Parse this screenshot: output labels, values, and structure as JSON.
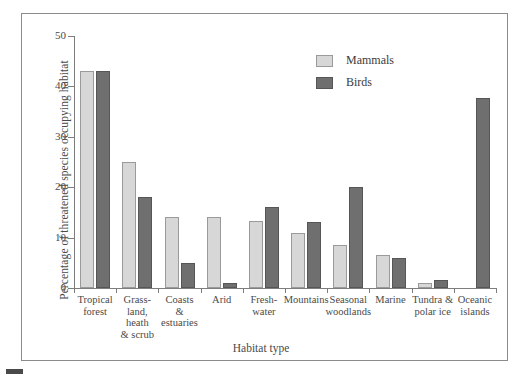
{
  "chart_data": {
    "type": "bar",
    "title": "",
    "xlabel": "Habitat type",
    "ylabel": "Percentage of threatened species occupying habitat",
    "ylim": [
      0,
      50
    ],
    "yticks": [
      0,
      10,
      20,
      30,
      40,
      50
    ],
    "grid": false,
    "legend_position": "top-right",
    "categories": [
      "Tropical forest",
      "Grass-land, heath & scrub",
      "Coasts & estuaries",
      "Arid",
      "Fresh-water",
      "Mountains",
      "Seasonal woodlands",
      "Marine",
      "Tundra & polar ice",
      "Oceanic islands"
    ],
    "category_lines": [
      [
        "Tropical",
        "forest"
      ],
      [
        "Grass-",
        "land,",
        "heath",
        "& scrub"
      ],
      [
        "Coasts",
        "&",
        "estuaries"
      ],
      [
        "Arid"
      ],
      [
        "Fresh-",
        "water"
      ],
      [
        "Mountains"
      ],
      [
        "Seasonal",
        "woodlands"
      ],
      [
        "Marine"
      ],
      [
        "Tundra &",
        "polar ice"
      ],
      [
        "Oceanic",
        "islands"
      ]
    ],
    "series": [
      {
        "name": "Mammals",
        "color": "#d7d7d7",
        "values": [
          43,
          25,
          14,
          14,
          13.3,
          11,
          8.5,
          6.5,
          1,
          0
        ]
      },
      {
        "name": "Birds",
        "color": "#6f6f6f",
        "values": [
          43,
          18,
          5,
          1,
          16,
          13,
          20,
          6,
          1.5,
          37.7
        ]
      }
    ]
  },
  "legend": {
    "items": [
      {
        "label": "Mammals"
      },
      {
        "label": "Birds"
      }
    ]
  },
  "axis": {
    "y_tick_labels": [
      "50",
      "40",
      "30",
      "20",
      "10",
      "0"
    ],
    "y_title": "Percentage of threatened species occupying habitat",
    "x_title": "Habitat type"
  }
}
